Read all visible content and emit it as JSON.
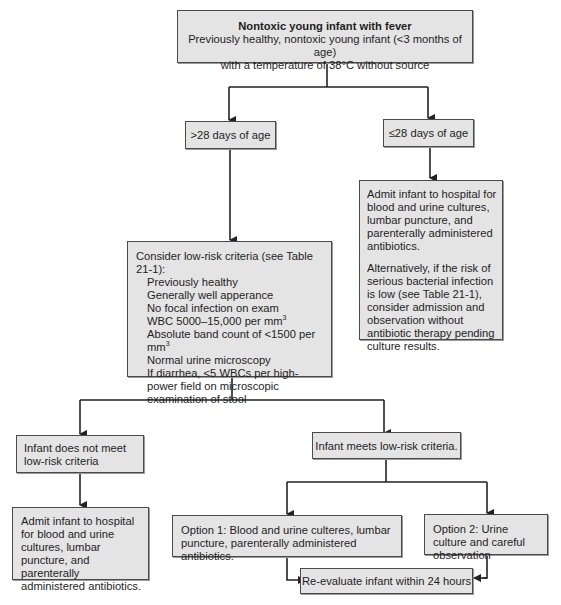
{
  "nodes": {
    "start": {
      "title": "Nontoxic young infant with fever",
      "line1": "Previously healthy, nontoxic young infant (<3 months of age)",
      "line2": "with a temperature of 38°C without source"
    },
    "older": {
      "label": ">28 days of age"
    },
    "younger": {
      "label": "≤28 days of age"
    },
    "younger_action": {
      "para1": "Admit infant to hospital for blood and urine cultures, lumbar puncture, and parenterally administered antibiotics.",
      "para2": "Alternatively, if the risk of serious bacterial infection is low (see Table 21-1), consider admission and observation without antibiotic therapy pending culture results."
    },
    "criteria": {
      "heading": "Consider low-risk criteria (see Table 21-1):",
      "items": [
        "Previously healthy",
        "Generally well apperance",
        "No focal infection on exam",
        "WBC 5000–15,000 per mm",
        "Absolute band count of <1500 per mm",
        "Normal urine microscopy",
        "If diarrhea, <5 WBCs per high-power field on microscopic examination of stool"
      ],
      "superscript": "3"
    },
    "not_low_risk": {
      "label": "Infant does not meet low-risk criteria"
    },
    "not_low_risk_action": {
      "label": "Admit infant to hospital for blood and urine cultures, lumbar puncture, and parenterally administered antibiotics."
    },
    "low_risk": {
      "label": "Infant meets low-risk criteria."
    },
    "option1": {
      "label": "Option 1: Blood and urine culteres, lumbar puncture, parenterally administered antibiotics."
    },
    "option2": {
      "label": "Option 2: Urine culture and careful observation"
    },
    "reevaluate": {
      "label": "Re-evaluate infant within 24 hours"
    }
  },
  "colors": {
    "box_fill": "#e4e4e4",
    "box_border": "#4a4a4a",
    "line": "#222222"
  }
}
